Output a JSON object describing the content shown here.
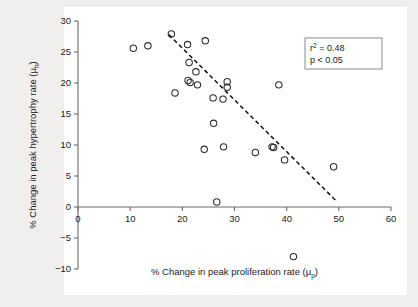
{
  "figure": {
    "background_color": "#f0efee",
    "plot_background_color": "#ffffff",
    "axis_color": "#6b6b6b",
    "marker_color": "#2b2b2b",
    "line_color": "#111111"
  },
  "annotations": {
    "r_squared_prefix": "r",
    "r_squared_exponent": "2",
    "r_squared_value": " = 0.48",
    "p_value": "p < 0.05"
  },
  "caption": {
    "text": ""
  },
  "chart_data": {
    "type": "scatter",
    "title": "",
    "xlabel": "% Change in peak proliferation rate (μp)",
    "xlabel_main": "% Change in peak proliferation rate (",
    "xlabel_mu": "μ",
    "xlabel_sub": "p",
    "xlabel_close": ")",
    "ylabel": "% Change in peak hypertrophy rate (μh)",
    "ylabel_main": "% Change in peak hypertrophy rate (",
    "ylabel_mu": "μ",
    "ylabel_sub": "h",
    "ylabel_close": ")",
    "xlim": [
      0,
      60
    ],
    "ylim": [
      -10,
      30
    ],
    "xticks": [
      0,
      10,
      20,
      30,
      40,
      50,
      60
    ],
    "yticks": [
      -10,
      -5,
      0,
      5,
      10,
      15,
      20,
      25,
      30
    ],
    "xtick_labels": [
      "0",
      "10",
      "20",
      "30",
      "40",
      "50",
      "60"
    ],
    "ytick_labels": [
      "-10",
      "-5",
      "0",
      "5",
      "10",
      "15",
      "20",
      "25",
      "30"
    ],
    "grid": false,
    "legend": "none",
    "marker_style": "open-circle",
    "marker_size": 4,
    "points": [
      {
        "x": 10.6,
        "y": 25.6
      },
      {
        "x": 13.4,
        "y": 26.0
      },
      {
        "x": 17.9,
        "y": 27.9
      },
      {
        "x": 18.6,
        "y": 18.4
      },
      {
        "x": 21.0,
        "y": 26.2
      },
      {
        "x": 21.3,
        "y": 23.3
      },
      {
        "x": 21.1,
        "y": 20.4
      },
      {
        "x": 21.5,
        "y": 20.1
      },
      {
        "x": 22.6,
        "y": 21.8
      },
      {
        "x": 22.9,
        "y": 19.7
      },
      {
        "x": 24.4,
        "y": 26.8
      },
      {
        "x": 24.2,
        "y": 9.3
      },
      {
        "x": 25.9,
        "y": 17.6
      },
      {
        "x": 26.0,
        "y": 13.5
      },
      {
        "x": 26.6,
        "y": 0.8
      },
      {
        "x": 27.8,
        "y": 17.4
      },
      {
        "x": 27.9,
        "y": 9.7
      },
      {
        "x": 28.6,
        "y": 20.2
      },
      {
        "x": 28.6,
        "y": 19.3
      },
      {
        "x": 34.0,
        "y": 8.8
      },
      {
        "x": 37.2,
        "y": 9.7
      },
      {
        "x": 37.5,
        "y": 9.6
      },
      {
        "x": 38.5,
        "y": 19.7
      },
      {
        "x": 39.6,
        "y": 7.6
      },
      {
        "x": 41.3,
        "y": -8.0
      },
      {
        "x": 49.0,
        "y": 6.5
      }
    ],
    "fit_line": {
      "style": "dashed",
      "x_start": 17.4,
      "y_start": 27.8,
      "x_end": 49.6,
      "y_end": 0.9,
      "r_squared": 0.48,
      "p_value": "< 0.05"
    }
  }
}
